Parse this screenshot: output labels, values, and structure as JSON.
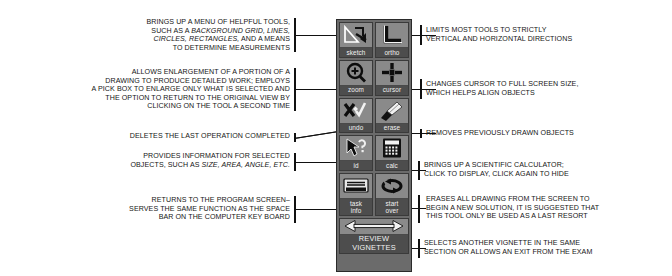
{
  "toolbar": {
    "name": "drawing-tool-palette",
    "colors": {
      "panel": "#6b6b6b",
      "cell": "#7d7d7d",
      "label_bg": "#4d4d4d",
      "label_text": "#f2f2f2",
      "ink": "#111111"
    },
    "tools": [
      {
        "id": "sketch",
        "label": "sketch",
        "icon": "sketch-arrow-icon"
      },
      {
        "id": "ortho",
        "label": "ortho",
        "icon": "ortho-angle-icon"
      },
      {
        "id": "zoom",
        "label": "zoom",
        "icon": "magnifier-plus-icon"
      },
      {
        "id": "cursor",
        "label": "cursor",
        "icon": "crosshair-cursor-icon"
      },
      {
        "id": "undo",
        "label": "undo",
        "icon": "x-check-undo-icon"
      },
      {
        "id": "erase",
        "label": "erase",
        "icon": "eraser-icon"
      },
      {
        "id": "id",
        "label": "id",
        "icon": "arrow-question-icon"
      },
      {
        "id": "calc",
        "label": "calc",
        "icon": "calculator-icon"
      },
      {
        "id": "task",
        "label": "task\ninfo",
        "icon": "task-info-document-icon"
      },
      {
        "id": "start",
        "label": "start\nover",
        "icon": "circular-arrow-icon"
      },
      {
        "id": "review",
        "label": "REVIEW\nVIGNETTES",
        "icon": "double-arrow-icon"
      }
    ]
  },
  "callouts": {
    "left": [
      {
        "target": "sketch",
        "lines": [
          [
            {
              "t": "BRINGS UP A MENU OF HELPFUL TOOLS,"
            }
          ],
          [
            {
              "t": "SUCH AS A "
            },
            {
              "t": "BACKGROUND GRID, LINES,",
              "i": true
            }
          ],
          [
            {
              "t": "CIRCLES, RECTANGLES,",
              "i": true
            },
            {
              "t": " AND A MEANS"
            }
          ],
          [
            {
              "t": "TO DETERMINE MEASUREMENTS"
            }
          ]
        ]
      },
      {
        "target": "zoom",
        "lines": [
          [
            {
              "t": "ALLOWS ENLARGEMENT OF A PORTION OF A"
            }
          ],
          [
            {
              "t": "DRAWING TO PRODUCE DETAILED WORK; EMPLOYS"
            }
          ],
          [
            {
              "t": "A PICK BOX TO ENLARGE ONLY WHAT IS SELECTED AND"
            }
          ],
          [
            {
              "t": "THE OPTION TO RETURN TO THE ORIGINAL VIEW BY"
            }
          ],
          [
            {
              "t": "CLICKING ON THE TOOL A SECOND TIME"
            }
          ]
        ]
      },
      {
        "target": "undo",
        "lines": [
          [
            {
              "t": "DELETES THE LAST OPERATION COMPLETED"
            }
          ]
        ]
      },
      {
        "target": "id",
        "lines": [
          [
            {
              "t": "PROVIDES INFORMATION FOR SELECTED"
            }
          ],
          [
            {
              "t": "OBJECTS, SUCH AS "
            },
            {
              "t": "SIZE, AREA, ANGLE, ETC.",
              "i": true
            }
          ]
        ]
      },
      {
        "target": "task",
        "lines": [
          [
            {
              "t": "RETURNS TO THE PROGRAM SCREEN–"
            }
          ],
          [
            {
              "t": "SERVES THE SAME FUNCTION AS THE SPACE"
            }
          ],
          [
            {
              "t": "BAR ON THE COMPUTER KEY BOARD"
            }
          ]
        ]
      }
    ],
    "right": [
      {
        "target": "ortho",
        "lines": [
          [
            {
              "t": "LIMITS MOST TOOLS TO STRICTLY"
            }
          ],
          [
            {
              "t": "VERTICAL AND HORIZONTAL DIRECTIONS"
            }
          ]
        ]
      },
      {
        "target": "cursor",
        "lines": [
          [
            {
              "t": "CHANGES CURSOR TO FULL SCREEN SIZE,"
            }
          ],
          [
            {
              "t": "WHICH HELPS ALIGN OBJECTS"
            }
          ]
        ]
      },
      {
        "target": "erase",
        "lines": [
          [
            {
              "t": "REMOVES PREVIOUSLY DRAWN OBJECTS"
            }
          ]
        ]
      },
      {
        "target": "calc",
        "lines": [
          [
            {
              "t": "BRINGS UP A SCIENTIFIC CALCULATOR;"
            }
          ],
          [
            {
              "t": "CLICK TO DISPLAY, CLICK AGAIN TO HIDE"
            }
          ]
        ]
      },
      {
        "target": "start",
        "lines": [
          [
            {
              "t": "ERASES ALL DRAWING FROM THE SCREEN TO"
            }
          ],
          [
            {
              "t": "BEGIN A NEW SOLUTION, IT IS SUGGESTED THAT"
            }
          ],
          [
            {
              "t": "THIS TOOL ONLY BE USED AS A LAST RESORT"
            }
          ]
        ]
      },
      {
        "target": "review",
        "lines": [
          [
            {
              "t": "SELECTS ANOTHER VIGNETTE IN THE SAME"
            }
          ],
          [
            {
              "t": "SECTION OR ALLOWS AN EXIT FROM THE EXAM"
            }
          ]
        ]
      }
    ]
  }
}
